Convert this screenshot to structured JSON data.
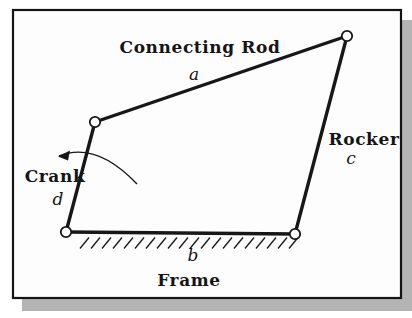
{
  "diagram": {
    "type": "four-bar-linkage-figure",
    "colors": {
      "ink": "#171717",
      "panel_fill": "#fdfdfd",
      "panel_border": "#141414",
      "shadow": "#b4b4b4",
      "background": "#ffffff",
      "joint_fill": "#ffffff"
    },
    "panel": {
      "x": 13,
      "y": 10,
      "w": 388,
      "h": 288,
      "border_width": 2.2
    },
    "shadow": {
      "x": 22,
      "y": 20,
      "w": 390,
      "h": 291
    },
    "joint_radius": 5.2,
    "joints": [
      {
        "name": "ground-left",
        "x": 66,
        "y": 232
      },
      {
        "name": "crank-coupler",
        "x": 95,
        "y": 122
      },
      {
        "name": "coupler-rocker",
        "x": 347,
        "y": 36
      },
      {
        "name": "ground-right",
        "x": 295,
        "y": 234
      }
    ],
    "links": [
      {
        "name": "crank",
        "from": 0,
        "to": 1
      },
      {
        "name": "connecting-rod",
        "from": 1,
        "to": 2
      },
      {
        "name": "rocker",
        "from": 2,
        "to": 3
      },
      {
        "name": "frame",
        "from": 3,
        "to": 0
      }
    ],
    "hatching": {
      "count": 20,
      "x_start": 80,
      "spacing": 11,
      "y_bottom": 248.5,
      "y_top": 237.5,
      "dx": 9
    },
    "rotation_arrow": {
      "path": "M 137 184 Q 96 141 59 156",
      "head_points": "58,156.5 70,150.5 68,160.5"
    },
    "labels": [
      {
        "name": "connecting-rod-label",
        "text": "Connecting Rod",
        "x": 200,
        "y": 53,
        "style": "name"
      },
      {
        "name": "connecting-rod-symbol",
        "text": "a",
        "x": 194,
        "y": 80,
        "style": "symbol"
      },
      {
        "name": "rocker-label",
        "text": "Rocker",
        "x": 364,
        "y": 145,
        "style": "name"
      },
      {
        "name": "rocker-symbol",
        "text": "c",
        "x": 351,
        "y": 164,
        "style": "symbol"
      },
      {
        "name": "crank-label",
        "text": "Crank",
        "x": 55,
        "y": 182,
        "style": "name"
      },
      {
        "name": "crank-symbol",
        "text": "d",
        "x": 58,
        "y": 205,
        "style": "symbol"
      },
      {
        "name": "frame-symbol",
        "text": "b",
        "x": 193,
        "y": 261,
        "style": "symbol"
      },
      {
        "name": "frame-label",
        "text": "Frame",
        "x": 189,
        "y": 286,
        "style": "name"
      }
    ]
  }
}
